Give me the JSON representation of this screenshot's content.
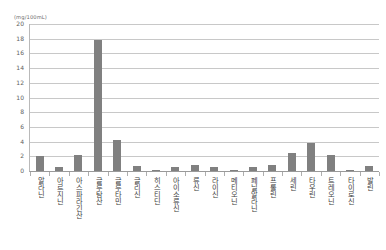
{
  "chart_data": {
    "type": "bar",
    "title": "",
    "xlabel": "",
    "ylabel": "(mg/100mL)",
    "unit_label": "(mg/100mL)",
    "ylim": [
      0,
      20
    ],
    "yticks": [
      20,
      18,
      16,
      14,
      12,
      10,
      8,
      6,
      4,
      2,
      0
    ],
    "grid": true,
    "legend": "none",
    "bar_color": "#808080",
    "categories": [
      "알라닌",
      "아르지닌",
      "아스파라긴산",
      "글루탐산",
      "글루타민",
      "글리신",
      "히스티딘",
      "아이소류신",
      "류신",
      "라이신",
      "메티오닌",
      "페닐알라닌",
      "프롤린",
      "세린",
      "타우린",
      "트레오닌",
      "타이로신",
      "발린"
    ],
    "values": [
      2.0,
      0.5,
      2.2,
      17.8,
      4.2,
      0.7,
      0.15,
      0.5,
      0.8,
      0.55,
      0.1,
      0.5,
      0.8,
      2.5,
      3.8,
      2.2,
      0.05,
      0.7
    ]
  }
}
